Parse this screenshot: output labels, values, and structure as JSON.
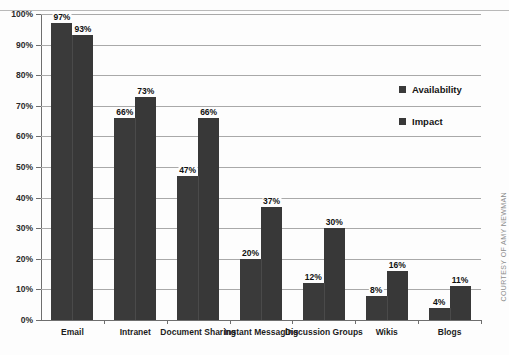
{
  "chart_data": {
    "type": "bar",
    "title": "",
    "xlabel": "",
    "ylabel": "",
    "ylim": [
      0,
      100
    ],
    "ytick_labels": [
      "100%",
      "90%",
      "80%",
      "70%",
      "60%",
      "50%",
      "40%",
      "30%",
      "20%",
      "10%",
      "0%"
    ],
    "ytick_values": [
      100,
      90,
      80,
      70,
      60,
      50,
      40,
      30,
      20,
      10,
      0
    ],
    "grid": true,
    "legend_position": "upper right",
    "categories": [
      "Email",
      "Intranet",
      "Document Sharing",
      "Instant Messaging",
      "Discussion Groups",
      "Wikis",
      "Blogs"
    ],
    "series": [
      {
        "name": "Availability",
        "values": [
          97,
          66,
          47,
          20,
          12,
          8,
          4
        ],
        "labels": [
          "97%",
          "66%",
          "47%",
          "20%",
          "12%",
          "8%",
          "4%"
        ],
        "color": "#3a3a3a"
      },
      {
        "name": "Impact",
        "values": [
          93,
          73,
          66,
          37,
          30,
          16,
          11
        ],
        "labels": [
          "93%",
          "73%",
          "66%",
          "37%",
          "30%",
          "16%",
          "11%"
        ],
        "color": "#383838"
      }
    ]
  },
  "legend": {
    "items": [
      {
        "label": "Availability",
        "color": "#3a3a3a"
      },
      {
        "label": "Impact",
        "color": "#383838"
      }
    ]
  },
  "credit": {
    "text": "COURTESY OF AMY NEWMAN"
  },
  "colors": {
    "bar": "#3a3a3a",
    "gridline": "#a9a9a9",
    "axis": "#6e6e6e",
    "background": "#fdfdfd",
    "text": "#1d1d1d"
  }
}
